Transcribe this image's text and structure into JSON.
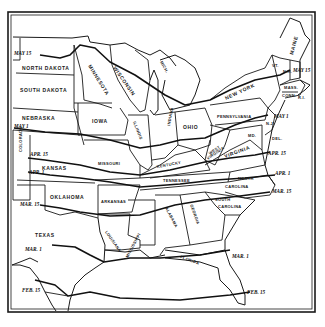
{
  "map": {
    "colors": {
      "ink": "#1a1a1a",
      "paper": "#ffffff"
    },
    "states": {
      "north_dakota": "NORTH DAKOTA",
      "south_dakota": "SOUTH DAKOTA",
      "nebraska": "NEBRASKA",
      "colorado": "COLORADO",
      "kansas": "KANSAS",
      "oklahoma": "OKLAHOMA",
      "texas": "TEXAS",
      "minnesota": "MINNESOTA",
      "iowa": "IOWA",
      "missouri": "MISSOURI",
      "arkansas": "ARKANSAS",
      "louisiana": "LOUISIANA",
      "wisconsin": "WISCONSIN",
      "illinois": "ILLINOIS",
      "michigan": "MICH.",
      "indiana": "INDIANA",
      "ohio": "OHIO",
      "kentucky": "KENTUCKY",
      "tennessee": "TENNESSEE",
      "mississippi": "MISSISSIPPI",
      "alabama": "ALABAMA",
      "georgia": "GEORGIA",
      "florida": "FLORIDA",
      "pennsylvania": "PENNSYLVANIA",
      "new_york": "NEW YORK",
      "west_virginia_1": "WEST",
      "west_virginia_2": "VIRGINIA",
      "virginia": "VIRGINIA",
      "north_carolina_1": "NORTH",
      "north_carolina_2": "CAROLINA",
      "south_carolina_1": "SOUTH",
      "south_carolina_2": "CAROLINA",
      "maryland": "MD.",
      "delaware": "DEL.",
      "new_jersey": "N.J.",
      "vermont": "VT.",
      "new_hampshire": "N.H.",
      "maine": "MAINE",
      "massachusetts": "MASS.",
      "connecticut": "CONN.",
      "rhode_island": "R.I."
    },
    "isolines": {
      "may15_west": "MAY 15",
      "may15_east": "MAY 15",
      "may1_west": "MAY 1",
      "may1_east": "MAY 1",
      "apr15_west": "APR. 15",
      "apr15_east": "APR. 15",
      "apr1_west": "APR. 1",
      "apr1_east": "APR. 1",
      "mar15_west": "MAR. 15",
      "mar15_east": "MAR. 15",
      "mar1_west": "MAR. 1",
      "mar1_east": "MAR. 1",
      "feb15_west": "FEB. 15",
      "feb15_east": "FEB. 15"
    }
  }
}
